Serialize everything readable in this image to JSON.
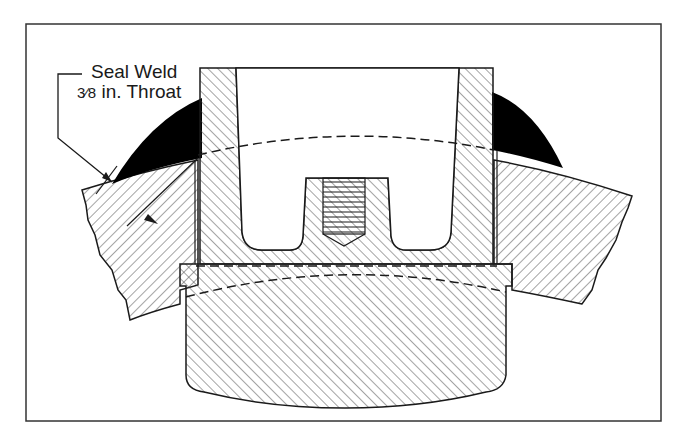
{
  "figure": {
    "annotation": {
      "line1": "Seal Weld",
      "fraction": "3⁄8",
      "line2_suffix": " in. Throat"
    },
    "colors": {
      "ink": "#1a1a1a",
      "hatch": "#4a4a4a",
      "weld_fill": "#000000",
      "background": "#ffffff"
    },
    "parts": [
      "outer-frame",
      "curved-shell-plate",
      "nozzle-body",
      "threaded-hole",
      "bottom-flange-pad",
      "seal-weld-left",
      "seal-weld-right",
      "hidden-line-upper",
      "hidden-line-lower",
      "leader-line",
      "throat-dimension-arrow"
    ]
  }
}
